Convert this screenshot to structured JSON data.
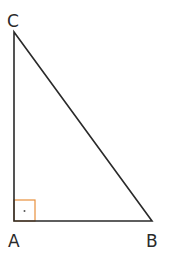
{
  "diagram": {
    "type": "right-triangle",
    "vertices": {
      "A": {
        "label": "A",
        "note": "right angle"
      },
      "B": {
        "label": "B"
      },
      "C": {
        "label": "C"
      }
    },
    "right_angle_marker_color": "#e8903c",
    "stroke_color": "#2a2a2a"
  }
}
